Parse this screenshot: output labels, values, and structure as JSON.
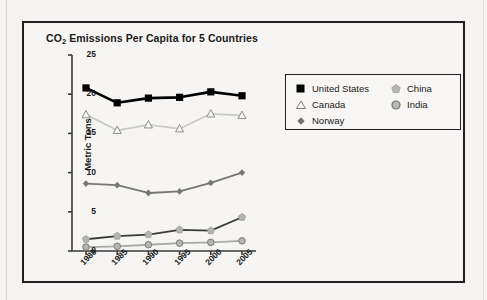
{
  "chart_title_prefix": "CO",
  "chart_title_sub": "2",
  "chart_title_rest": " Emissions Per Capita for 5 Countries",
  "chart_data": {
    "type": "line",
    "title": "CO2 Emissions Per Capita for 5 Countries",
    "xlabel": "",
    "ylabel": "Metric Tons",
    "x": [
      "1980",
      "1985",
      "1990",
      "1995",
      "2000",
      "2005"
    ],
    "xtick_labels": [
      "1980",
      "1985",
      "1990",
      "1995",
      "2000",
      "2005"
    ],
    "ytick_labels": [
      "0",
      "5",
      "10",
      "15",
      "20",
      "25"
    ],
    "ylim": [
      0,
      25
    ],
    "grid": false,
    "legend_position": "right",
    "series": [
      {
        "name": "United States",
        "values": [
          20.8,
          18.9,
          19.5,
          19.6,
          20.3,
          19.8
        ],
        "color": "#000000",
        "marker": "square-filled"
      },
      {
        "name": "Canada",
        "values": [
          17.4,
          15.4,
          16.1,
          15.6,
          17.5,
          17.3
        ],
        "color": "#c9c9c7",
        "marker": "triangle-open"
      },
      {
        "name": "Norway",
        "values": [
          8.6,
          8.4,
          7.4,
          7.6,
          8.7,
          10.0
        ],
        "color": "#777775",
        "marker": "diamond-filled"
      },
      {
        "name": "China",
        "values": [
          1.5,
          1.9,
          2.1,
          2.7,
          2.6,
          4.3
        ],
        "color": "#3a3a38",
        "marker": "pentagon-filled"
      },
      {
        "name": "India",
        "values": [
          0.5,
          0.6,
          0.8,
          1.0,
          1.1,
          1.3
        ],
        "color": "#a8a8a6",
        "marker": "circle-filled"
      }
    ]
  },
  "legend": {
    "columns": [
      {
        "items": [
          {
            "label": "United States",
            "marker": "square-filled-icon"
          },
          {
            "label": "Canada",
            "marker": "triangle-open-icon"
          },
          {
            "label": "Norway",
            "marker": "diamond-filled-icon"
          }
        ]
      },
      {
        "items": [
          {
            "label": "China",
            "marker": "pentagon-filled-icon"
          },
          {
            "label": "India",
            "marker": "circle-filled-icon"
          }
        ]
      }
    ]
  },
  "colors": {
    "frame": "#231f20",
    "background": "#f4f3f1",
    "axis": "#3a3a38"
  }
}
